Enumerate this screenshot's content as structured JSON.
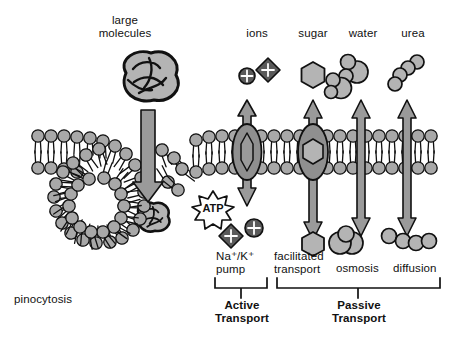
{
  "diagram": {
    "colors": {
      "head_fill": "#a8a8a8",
      "protein_fill": "#8f8f8f",
      "arrow_fill": "#9a9a9a",
      "molecule_fill": "#b4b4b4",
      "ion_dark": "#5a5a5a",
      "outline": "#111111",
      "background": "#ffffff"
    },
    "top_labels": [
      {
        "id": "large-molecules",
        "text": "large\nmolecules",
        "x": 82,
        "y": 14,
        "w": 86
      },
      {
        "id": "ions",
        "text": "ions",
        "x": 234,
        "y": 27,
        "w": 46
      },
      {
        "id": "sugar",
        "text": "sugar",
        "x": 290,
        "y": 27,
        "w": 46
      },
      {
        "id": "water",
        "text": "water",
        "x": 338,
        "y": 27,
        "w": 50
      },
      {
        "id": "urea",
        "text": "urea",
        "x": 390,
        "y": 27,
        "w": 46
      }
    ],
    "bottom_labels": [
      {
        "id": "pinocytosis",
        "text": "pinocytosis",
        "x": 14,
        "y": 293,
        "w": 90,
        "align": "left"
      },
      {
        "id": "na-k-pump",
        "text": "Na⁺/K⁺\npump",
        "x": 216,
        "y": 250,
        "w": 66,
        "align": "left"
      },
      {
        "id": "facilitated-transport",
        "text": "facilitated\ntransport",
        "x": 274,
        "y": 250,
        "w": 72,
        "align": "left"
      },
      {
        "id": "osmosis",
        "text": "osmosis",
        "x": 336,
        "y": 262,
        "w": 56,
        "align": "left"
      },
      {
        "id": "diffusion",
        "text": "diffusion",
        "x": 393,
        "y": 262,
        "w": 56,
        "align": "left"
      }
    ],
    "brackets": [
      {
        "id": "active-transport",
        "label": "Active\nTransport",
        "x1": 215,
        "x2": 267,
        "y": 281,
        "label_x": 212,
        "label_y": 298,
        "label_w": 60
      },
      {
        "id": "passive-transport",
        "label": "Passive\nTransport",
        "x1": 277,
        "x2": 440,
        "y": 281,
        "label_x": 328,
        "label_y": 298,
        "label_w": 62
      }
    ],
    "membrane": {
      "top_head_y": 136,
      "bottom_head_y": 168,
      "left_x": 32,
      "right_x": 441,
      "head_radius": 6.2,
      "spacing": 12.6
    },
    "molecules": {
      "ion_sphere": {
        "label": "ion-sphere-plus",
        "x": 247,
        "y": 76,
        "r": 8
      },
      "ion_diamond": {
        "label": "ion-diamond-plus",
        "x": 268,
        "y": 70,
        "r": 11
      },
      "sugar_hexagon": {
        "label": "sugar-hexagon",
        "x": 313,
        "y": 75,
        "r": 13
      },
      "water_clusters": [
        {
          "x": 352,
          "y": 68
        },
        {
          "x": 340,
          "y": 84
        }
      ],
      "urea_chains": [
        {
          "x": 402,
          "y": 72
        }
      ]
    },
    "atp": {
      "label": "ATP",
      "x": 213,
      "y": 207,
      "r": 15
    },
    "channels": [
      {
        "id": "na-k-pump-protein",
        "x": 247,
        "cargo": "lens"
      },
      {
        "id": "facilitated-protein",
        "x": 313,
        "cargo": "hexagon"
      }
    ],
    "free_arrows": [
      {
        "id": "osmosis-arrow",
        "x": 361
      },
      {
        "id": "diffusion-arrow",
        "x": 407
      }
    ]
  }
}
